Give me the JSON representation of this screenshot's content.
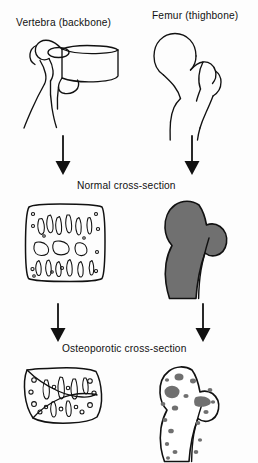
{
  "figure": {
    "title_present": false,
    "background_color": "#fdfdfd",
    "ink_color": "#111111",
    "bone_fill_normal_color": "#707070",
    "bone_fill_empty_color": "#ffffff",
    "columns": [
      {
        "key": "vertebra",
        "label": "Vertebra (backbone)"
      },
      {
        "key": "femur",
        "label": "Femur (thighbone)"
      }
    ],
    "rows": [
      {
        "key": "whole-bone",
        "label": ""
      },
      {
        "key": "normal",
        "label": "Normal cross-section"
      },
      {
        "key": "osteoporotic",
        "label": "Osteoporotic cross-section"
      }
    ]
  },
  "labels": {
    "vertebra": "Vertebra (backbone)",
    "femur": "Femur (thighbone)",
    "normal_cross_section": "Normal cross-section",
    "osteoporotic_cross_section": "Osteoporotic cross-section"
  },
  "arrows": {
    "count": 4,
    "direction": "down",
    "style": "solid-triangle-head",
    "items": [
      {
        "name": "vertebra-to-normal",
        "column": "vertebra",
        "from_row": "whole-bone",
        "to_row": "normal"
      },
      {
        "name": "femur-to-normal",
        "column": "femur",
        "from_row": "whole-bone",
        "to_row": "normal"
      },
      {
        "name": "vertebra-to-osteoporotic",
        "column": "vertebra",
        "from_row": "normal",
        "to_row": "osteoporotic"
      },
      {
        "name": "femur-to-osteoporotic",
        "column": "femur",
        "from_row": "normal",
        "to_row": "osteoporotic"
      }
    ]
  },
  "illustrations": [
    {
      "name": "vertebra-whole-bone",
      "style": "line-drawing",
      "filled": false
    },
    {
      "name": "femur-whole-bone",
      "style": "line-drawing",
      "filled": false
    },
    {
      "name": "vertebra-normal-cross-section",
      "style": "dense-trabecular-texture",
      "filled": false
    },
    {
      "name": "femur-normal-cross-section",
      "style": "solid-gray-fill",
      "filled": true
    },
    {
      "name": "vertebra-osteoporotic-cross-section",
      "style": "sparse-trabecular-texture-compressed",
      "filled": false
    },
    {
      "name": "femur-osteoporotic-cross-section",
      "style": "scattered-gray-patches",
      "filled": false
    }
  ]
}
